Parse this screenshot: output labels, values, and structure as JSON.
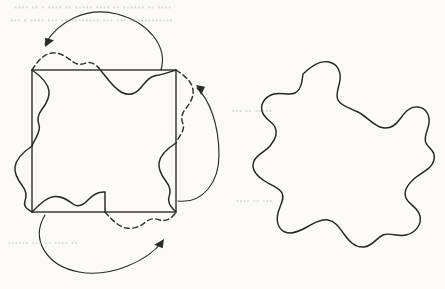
{
  "figure": {
    "background_color": "#fbfaf8",
    "ink_color": "#262626",
    "width": 445,
    "height": 289,
    "ghost_text": {
      "note": "faint show-through from the reverse of the scanned page; illegible",
      "line_1": "•••• •• • •••• •• ••••• •••• •• •••••• •• ••••",
      "line_2": "••• • •••• ••• •• •••••••• ••• ••• ••••••••••••",
      "line_3": "••• •• •••••",
      "line_4": "•••• •• •••",
      "line_5": "•••••• ••• •• •••• ••"
    },
    "left_panel": {
      "name": "square-with-deformed-edges",
      "square": {
        "x": 32,
        "y": 70,
        "width": 144,
        "height": 142,
        "corners": [
          [
            32,
            70
          ],
          [
            176,
            70
          ],
          [
            176,
            212
          ],
          [
            32,
            212
          ]
        ]
      },
      "edge_curves": [
        {
          "name": "top-edge-solid-inward",
          "style": "solid",
          "direction": "inward",
          "path": "M 100.5 70 C 108 79.5 114 88.5 122 92.5 C 130 96.5 136.5 93 141 87.5 C 145.5 82 149.5 76.5 156 75.5 C 163 74.5 170 72 176 70"
        },
        {
          "name": "top-edge-dashed-outward",
          "style": "dashed",
          "direction": "outward",
          "path": "M 32 70 C 38 60.5 44 54 52 53 C 60 52 66.5 57 71 60.5 C 75.5 64 79.5 65.5 86 63 C 93 60.5 99 68 100.5 70"
        },
        {
          "name": "right-edge-dashed-outward",
          "style": "dashed",
          "direction": "outward",
          "path": "M 176 70 C 185.5 76 192 82 193 90 C 194 98 189 104.5 185.5 109 C 182 113.5 180.5 117.5 183 124 C 185.5 131 178 137 176 143"
        },
        {
          "name": "right-edge-solid-inward",
          "style": "solid",
          "direction": "inward",
          "path": "M 176 143 C 166.5 149 160 155 159 163 C 158 171 163 177.5 166.5 182 C 170 186.5 171.5 190.5 169 197 C 166.5 204 174 210 176 212"
        },
        {
          "name": "bottom-edge-solid-inward",
          "style": "solid",
          "direction": "inward",
          "path": "M 32 212 C 40.5 203.5 47 197 55 196.5 C 63 196 68 200.5 73 204 C 78 207.5 83 205.5 88 200 C 93 194.5 98.5 191.5 105 192 C 105 192 105 205 105 212"
        },
        {
          "name": "bottom-edge-dashed-outward",
          "style": "dashed",
          "direction": "outward",
          "path": "M 105 212 C 112 219.5 118 226.5 126 228 C 134 229.5 140.5 226 145 222.5 C 149.5 219 153.5 217.5 160 220 C 167 222.5 174 216 176 212"
        },
        {
          "name": "left-edge-solid-inward",
          "style": "solid",
          "direction": "inward",
          "path": "M 32 70 C 41.5 76.5 48 83 49 91 C 50 99 45 105.5 41.5 110 C 38 114.5 36.5 118.5 39 125 C 41.5 132 34 139.5 32 146"
        },
        {
          "name": "left-edge-solid-outward",
          "style": "solid",
          "direction": "outward",
          "path": "M 32 146 C 22.5 152.5 16 159 15 167 C 14 175 19 181.5 22.5 186 C 26 190.5 27.5 194.5 25 201 C 22.5 208 30 210 32 212"
        }
      ],
      "arrows": [
        {
          "name": "top-transfer-arrow",
          "path": "M 161 70 C 168 46 148 22 117 14 C 86 6 58 22 45 44",
          "head_at": [
            45,
            47
          ],
          "head_angle_deg": 121,
          "meaning": "maps the inward top bump to the outward bump"
        },
        {
          "name": "right-transfer-arrow",
          "path": "M 178 201 C 203 204 219 182 219 155 C 219 124 209 99 197 88",
          "head_at": [
            196,
            85
          ],
          "head_angle_deg": 221,
          "meaning": "maps the inward right bump to the outward bump"
        },
        {
          "name": "bottom-transfer-arrow",
          "path": "M 45 215 C 30 240 47 266 79 272 C 112 278 148 260 162 242",
          "head_at": [
            164,
            239
          ],
          "head_angle_deg": 308,
          "meaning": "maps the inward bottom bump to the outward bump"
        }
      ]
    },
    "right_panel": {
      "name": "resulting-tile",
      "description": "closed wavy tile with four-fold symmetry obtained from the deformed square",
      "bounds": {
        "x": 258,
        "y": 59,
        "width": 178,
        "height": 190
      },
      "path": "M 303 74 C 311 66 320 60 329 62 C 338 64 341 72 340 80 C 339 88 335 94 338 100 C 341 106 350 108 358 112 C 366 116 372 124 380 127 C 388 130 395 126 400 119 C 405 112 410 106 418 107 C 426 108 430 115 429 123 C 428 131 423 137 426 143 C 429 149 436 151 434 160 C 432 169 422 172 415 178 C 408 184 403 191 406 198 C 409 205 418 207 420 216 C 422 225 415 233 406 235 C 397 237 390 232 383 235 C 376 238 373 246 364 247 C 355 248 349 241 344 234 C 339 227 335 221 328 220 C 321 219 314 223 307 227 C 300 231 292 235 285 232 C 278 229 276 221 278 213 C 280 205 285 199 282 193 C 279 187 270 185 263 180 C 256 175 251 168 254 161 C 257 154 265 152 270 146 C 275 140 278 133 275 127 C 272 121 264 119 262 111 C 260 103 266 96 274 94 C 282 92 289 96 295 93 C 301 90 302 82 303 74 Z"
    }
  }
}
